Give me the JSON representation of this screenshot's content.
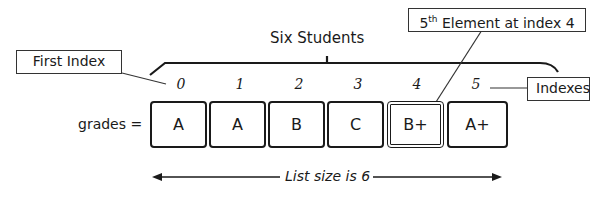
{
  "diagram": {
    "title": "Six Students",
    "variable_label": "grades =",
    "indices": [
      "0",
      "1",
      "2",
      "3",
      "4",
      "5"
    ],
    "elements": [
      "A",
      "A",
      "B",
      "C",
      "B+",
      "A+"
    ],
    "highlighted_index": 4,
    "callouts": {
      "first_index": "First Index",
      "fifth_element": "5th Element at index 4",
      "fifth_element_parts": {
        "num": "5",
        "sup": "th",
        "rest": " Element at index 4"
      },
      "indexes": "Indexes"
    },
    "size_label": "List size is 6"
  }
}
